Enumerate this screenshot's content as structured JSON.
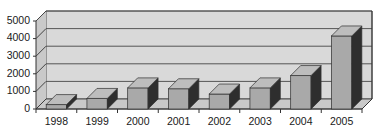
{
  "chart_data": {
    "type": "bar",
    "title": "",
    "subtitle": "",
    "xlabel": "",
    "ylabel": "",
    "categories": [
      "1998",
      "1999",
      "2000",
      "2001",
      "2002",
      "2003",
      "2004",
      "2005"
    ],
    "values": [
      250,
      600,
      1200,
      1150,
      850,
      1200,
      1900,
      4150
    ],
    "ylim": [
      0,
      5000
    ],
    "yticks": [
      0,
      1000,
      2000,
      3000,
      4000,
      5000
    ],
    "ytick_labels": [
      "0",
      "1000",
      "2000",
      "3000",
      "4000",
      "5000"
    ],
    "grid": true,
    "grid_axis": "y",
    "legend": false,
    "legend_position": "none",
    "style": "3d-column",
    "series": [
      {
        "name": "Series 1",
        "values": [
          250,
          600,
          1200,
          1150,
          850,
          1200,
          1900,
          4150
        ]
      }
    ]
  },
  "colors": {
    "background": "#ffffff",
    "plot_wall": "#d9d9d9",
    "plot_floor": "#c9c9c9",
    "gridline": "#555555",
    "axis": "#333333",
    "bar_front": "#a9a9a9",
    "bar_side": "#2e2e2e",
    "bar_top": "#bdbdbd",
    "tick_text": "#1a1a1a"
  },
  "axes": {
    "y_axis_name": "value-axis",
    "x_axis_name": "category-axis"
  }
}
